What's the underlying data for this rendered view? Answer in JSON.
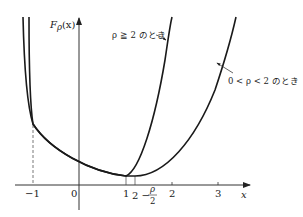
{
  "figure": {
    "y_axis_label": "F",
    "y_axis_label_sub": "ρ",
    "y_axis_label_arg": "(x)",
    "x_axis_label": "x",
    "x_ticks": [
      {
        "label": "−1",
        "value": -1
      },
      {
        "label": "0",
        "value": 0
      },
      {
        "label": "1",
        "value": 1
      },
      {
        "label": "2",
        "value": 2
      },
      {
        "label": "3",
        "value": 3
      }
    ],
    "special_tick": {
      "prefix": "2 −",
      "frac_num": "ρ",
      "frac_den": "2"
    },
    "annotations": {
      "curve_a": "ρ ≧ 2 のとき",
      "curve_b": "0 < ρ < 2 のとき"
    },
    "colors": {
      "curve": "#1a1a1a",
      "axis": "#333333",
      "dashed": "#555555"
    }
  }
}
